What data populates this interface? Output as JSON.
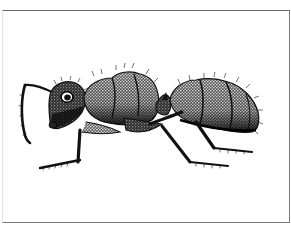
{
  "figure": {
    "style": "stippled ink illustration",
    "alt": "Side view of an ant in black-and-white stipple drawing",
    "frame_color": "#6a6a6a",
    "ink_color": "#111111",
    "background": "#ffffff"
  }
}
